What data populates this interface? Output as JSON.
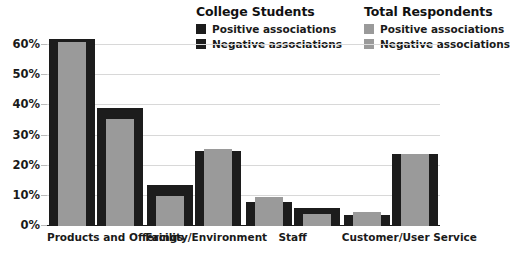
{
  "chart_data": {
    "type": "bar",
    "title": "",
    "xlabel": "",
    "ylabel": "",
    "ylim": [
      0,
      65
    ],
    "grid": true,
    "legend_position": "top-right",
    "categories": [
      "Products and Offerings",
      "Facility/Environment",
      "Staff",
      "Customer/User Service"
    ],
    "tick_labels": [
      "0%",
      "10%",
      "20%",
      "30%",
      "40%",
      "50%",
      "60%"
    ],
    "tick_values": [
      0,
      10,
      20,
      30,
      40,
      50,
      60
    ],
    "series": [
      {
        "name": "College Students - Positive associations",
        "group": "College Students",
        "key": "cs_pos",
        "color": "#1c1c1c",
        "values": [
          62,
          13.5,
          8,
          3.5
        ]
      },
      {
        "name": "College Students - Negative associations",
        "group": "College Students",
        "key": "cs_neg",
        "color": "#1c1c1c",
        "values": [
          39,
          24.8,
          6,
          24
        ]
      },
      {
        "name": "Total Respondents - Positive associations",
        "group": "Total Respondents",
        "key": "tr_pos",
        "color": "#9a9a9a",
        "values": [
          61,
          10,
          9.5,
          4.5
        ]
      },
      {
        "name": "Total Respondents - Negative associations",
        "group": "Total Respondents",
        "key": "tr_neg",
        "color": "#9a9a9a",
        "values": [
          35.5,
          25.7,
          4,
          24
        ]
      }
    ],
    "bars": [
      {
        "category": "Products and Offerings",
        "positive": {
          "students": 62,
          "total": 61
        },
        "negative": {
          "students": 39,
          "total": 35.5
        }
      },
      {
        "category": "Facility/Environment",
        "positive": {
          "students": 13.5,
          "total": 10
        },
        "negative": {
          "students": 24.8,
          "total": 25.7
        }
      },
      {
        "category": "Staff",
        "positive": {
          "students": 8,
          "total": 9.5
        },
        "negative": {
          "students": 6,
          "total": 4
        }
      },
      {
        "category": "Customer/User Service",
        "positive": {
          "students": 3.5,
          "total": 4.5
        },
        "negative": {
          "students": 24,
          "total": 24
        }
      }
    ]
  },
  "legend": {
    "groups": [
      {
        "title": "College Students",
        "entries": [
          {
            "label": "Positive associations",
            "color": "#1c1c1c"
          },
          {
            "label": "Negative associations",
            "color": "#1c1c1c"
          }
        ]
      },
      {
        "title": "Total Respondents",
        "entries": [
          {
            "label": "Positive associations",
            "color": "#9a9a9a"
          },
          {
            "label": "Negative associations",
            "color": "#9a9a9a"
          }
        ]
      }
    ]
  },
  "colors": {
    "students": "#1c1c1c",
    "total": "#9a9a9a",
    "grid": "#d8d8d8",
    "axis": "#1a1a1a",
    "background": "#ffffff"
  }
}
